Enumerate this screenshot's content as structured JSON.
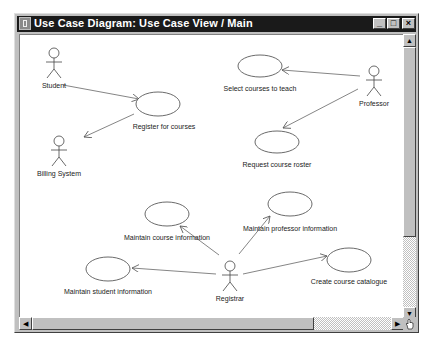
{
  "window": {
    "title": "Use Case Diagram: Use Case View / Main",
    "controls": {
      "minimize": "_",
      "maximize": "□",
      "close": "×"
    }
  },
  "diagram": {
    "actors": [
      {
        "id": "student",
        "label": "Student"
      },
      {
        "id": "billing-system",
        "label": "Billing System"
      },
      {
        "id": "professor",
        "label": "Professor"
      },
      {
        "id": "registrar",
        "label": "Registrar"
      }
    ],
    "use_cases": [
      {
        "id": "register-for-courses",
        "label": "Register for courses"
      },
      {
        "id": "select-courses-to-teach",
        "label": "Select courses to teach"
      },
      {
        "id": "request-course-roster",
        "label": "Request course roster"
      },
      {
        "id": "maintain-course-information",
        "label": "Maintain course information"
      },
      {
        "id": "maintain-professor-information",
        "label": "Maintain professor information"
      },
      {
        "id": "maintain-student-information",
        "label": "Maintain student information"
      },
      {
        "id": "create-course-catalogue",
        "label": "Create course catalogue"
      }
    ],
    "associations": [
      {
        "from": "student",
        "to": "register-for-courses"
      },
      {
        "from": "register-for-courses",
        "to": "billing-system"
      },
      {
        "from": "professor",
        "to": "select-courses-to-teach"
      },
      {
        "from": "professor",
        "to": "request-course-roster"
      },
      {
        "from": "registrar",
        "to": "maintain-course-information"
      },
      {
        "from": "registrar",
        "to": "maintain-professor-information"
      },
      {
        "from": "registrar",
        "to": "maintain-student-information"
      },
      {
        "from": "registrar",
        "to": "create-course-catalogue"
      }
    ]
  },
  "scrollbars": {
    "up": "▲",
    "down": "▼",
    "left": "◀",
    "right": "▶"
  }
}
